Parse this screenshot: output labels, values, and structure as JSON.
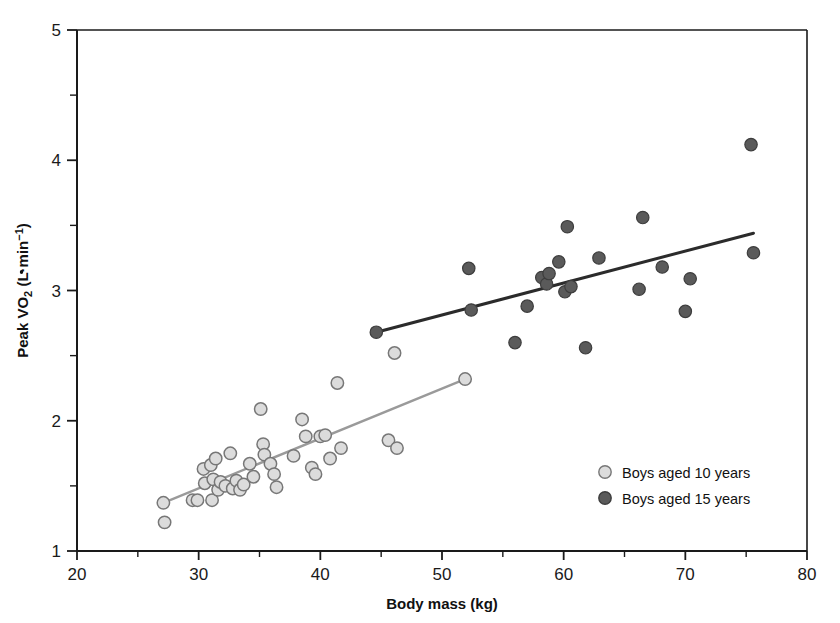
{
  "chart_data": {
    "type": "scatter",
    "title": "",
    "xlabel": "Body mass (kg)",
    "ylabel": "Peak V̇O₂ (L·min⁻¹)",
    "ylabel_parts": {
      "prefix": "Peak V",
      "dot": "̇",
      "o": "O",
      "sub": "2",
      "unit_open": " (L",
      "middot": "·",
      "unit_min": "min",
      "unit_exp": "−1",
      "unit_close": ")"
    },
    "xlim": [
      20,
      80
    ],
    "ylim": [
      1,
      5
    ],
    "x_major_ticks": [
      20,
      30,
      40,
      50,
      60,
      70,
      80
    ],
    "x_minor_ticks": [
      25,
      35,
      45,
      55,
      65,
      75
    ],
    "y_major_ticks": [
      1,
      2,
      3,
      4,
      5
    ],
    "y_minor_ticks": [
      1.5,
      2.5,
      3.5,
      4.5
    ],
    "x_tick_labels": [
      "20",
      "30",
      "40",
      "50",
      "60",
      "70",
      "80"
    ],
    "y_tick_labels": [
      "1",
      "2",
      "3",
      "4",
      "5"
    ],
    "grid": false,
    "legend_position": "bottom-right",
    "series": [
      {
        "name": "Boys aged 10 years",
        "marker": "open-circle",
        "marker_fill": "#dcdcdc",
        "marker_stroke": "#777777",
        "line_color": "#9a9a9a",
        "trendline": {
          "x1": 27.1,
          "y1": 1.37,
          "x2": 51.9,
          "y2": 2.32
        },
        "points": [
          {
            "x": 27.1,
            "y": 1.37
          },
          {
            "x": 27.2,
            "y": 1.22
          },
          {
            "x": 29.5,
            "y": 1.39
          },
          {
            "x": 29.9,
            "y": 1.39
          },
          {
            "x": 30.4,
            "y": 1.63
          },
          {
            "x": 30.5,
            "y": 1.52
          },
          {
            "x": 31.0,
            "y": 1.66
          },
          {
            "x": 31.1,
            "y": 1.39
          },
          {
            "x": 31.2,
            "y": 1.55
          },
          {
            "x": 31.4,
            "y": 1.71
          },
          {
            "x": 31.6,
            "y": 1.47
          },
          {
            "x": 31.8,
            "y": 1.53
          },
          {
            "x": 32.2,
            "y": 1.5
          },
          {
            "x": 32.6,
            "y": 1.75
          },
          {
            "x": 32.8,
            "y": 1.48
          },
          {
            "x": 33.1,
            "y": 1.54
          },
          {
            "x": 33.4,
            "y": 1.47
          },
          {
            "x": 33.7,
            "y": 1.51
          },
          {
            "x": 34.2,
            "y": 1.67
          },
          {
            "x": 34.5,
            "y": 1.57
          },
          {
            "x": 35.1,
            "y": 2.09
          },
          {
            "x": 35.3,
            "y": 1.82
          },
          {
            "x": 35.4,
            "y": 1.74
          },
          {
            "x": 35.9,
            "y": 1.67
          },
          {
            "x": 36.2,
            "y": 1.59
          },
          {
            "x": 36.4,
            "y": 1.49
          },
          {
            "x": 37.8,
            "y": 1.73
          },
          {
            "x": 38.5,
            "y": 2.01
          },
          {
            "x": 38.8,
            "y": 1.88
          },
          {
            "x": 39.3,
            "y": 1.64
          },
          {
            "x": 39.6,
            "y": 1.59
          },
          {
            "x": 40.0,
            "y": 1.88
          },
          {
            "x": 40.4,
            "y": 1.89
          },
          {
            "x": 40.8,
            "y": 1.71
          },
          {
            "x": 41.4,
            "y": 2.29
          },
          {
            "x": 41.7,
            "y": 1.79
          },
          {
            "x": 45.6,
            "y": 1.85
          },
          {
            "x": 46.3,
            "y": 1.79
          },
          {
            "x": 46.1,
            "y": 2.52
          },
          {
            "x": 51.9,
            "y": 2.32
          }
        ]
      },
      {
        "name": "Boys aged 15 years",
        "marker": "filled-circle",
        "marker_fill": "#5a5a5a",
        "marker_stroke": "#3d3d3d",
        "line_color": "#2b2b2b",
        "trendline": {
          "x1": 44.6,
          "y1": 2.68,
          "x2": 75.6,
          "y2": 3.44
        },
        "points": [
          {
            "x": 44.6,
            "y": 2.68
          },
          {
            "x": 52.2,
            "y": 3.17
          },
          {
            "x": 52.4,
            "y": 2.85
          },
          {
            "x": 56.0,
            "y": 2.6
          },
          {
            "x": 57.0,
            "y": 2.88
          },
          {
            "x": 58.2,
            "y": 3.1
          },
          {
            "x": 58.6,
            "y": 3.05
          },
          {
            "x": 58.8,
            "y": 3.13
          },
          {
            "x": 59.6,
            "y": 3.22
          },
          {
            "x": 60.1,
            "y": 2.99
          },
          {
            "x": 60.3,
            "y": 3.49
          },
          {
            "x": 60.6,
            "y": 3.03
          },
          {
            "x": 61.8,
            "y": 2.56
          },
          {
            "x": 62.9,
            "y": 3.25
          },
          {
            "x": 66.2,
            "y": 3.01
          },
          {
            "x": 66.5,
            "y": 3.56
          },
          {
            "x": 68.1,
            "y": 3.18
          },
          {
            "x": 70.0,
            "y": 2.84
          },
          {
            "x": 70.4,
            "y": 3.09
          },
          {
            "x": 75.4,
            "y": 4.12
          },
          {
            "x": 75.6,
            "y": 3.29
          }
        ]
      }
    ]
  },
  "legend": {
    "items": [
      {
        "label": "Boys aged 10 years",
        "marker": "open-circle"
      },
      {
        "label": "Boys aged 15 years",
        "marker": "filled-circle"
      }
    ]
  },
  "colors": {
    "axis": "#1a1a1a",
    "background": "#ffffff",
    "series10_fill": "#dcdcdc",
    "series10_stroke": "#777777",
    "series10_line": "#9a9a9a",
    "series15_fill": "#5a5a5a",
    "series15_stroke": "#3d3d3d",
    "series15_line": "#2b2b2b"
  }
}
